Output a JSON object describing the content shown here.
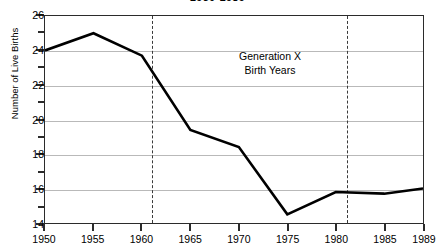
{
  "chart_data": {
    "type": "line",
    "title": "1950-1989",
    "xlabel": "",
    "ylabel": "Number of Live Births",
    "xlim": [
      1950,
      1989
    ],
    "ylim": [
      14,
      26
    ],
    "grid": true,
    "legend": false,
    "x": [
      1950,
      1955,
      1960,
      1965,
      1970,
      1975,
      1980,
      1985,
      1989
    ],
    "values": [
      24.0,
      25.0,
      23.7,
      19.4,
      18.4,
      14.5,
      15.8,
      15.7,
      16.0
    ],
    "series": [
      {
        "name": "Number of Live Births",
        "values": [
          24.0,
          25.0,
          23.7,
          19.4,
          18.4,
          14.5,
          15.8,
          15.7,
          16.0
        ],
        "color": "#000000"
      }
    ],
    "categories": [
      "1950",
      "1955",
      "1960",
      "1965",
      "1970",
      "1975",
      "1980",
      "1985",
      "1989"
    ],
    "xticks": [
      "1950",
      "1955",
      "1960",
      "1965",
      "1970",
      "1975",
      "1980",
      "1985",
      "1989"
    ],
    "yticks": [
      "14",
      "16",
      "18",
      "20",
      "22",
      "24",
      "26"
    ],
    "y_minor_ticks": [
      15,
      17,
      19,
      21,
      23,
      25
    ],
    "gridlines": [
      16,
      18,
      20,
      22,
      24
    ],
    "annotations": [
      {
        "name": "generation-x-label",
        "line1": "Generation X",
        "line2": "Birth Years",
        "x": 1970,
        "y": 22.4
      },
      {
        "name": "gen-x-start-marker",
        "type": "vline-dashed",
        "x": 1961
      },
      {
        "name": "gen-x-end-marker",
        "type": "vline-dashed",
        "x": 1981
      }
    ],
    "colors": {
      "series_line": "#000000",
      "axis": "#2b2b2b",
      "gridline": "#b9b9b9",
      "event_line": "#3a3a3a",
      "background": "#ffffff"
    }
  }
}
